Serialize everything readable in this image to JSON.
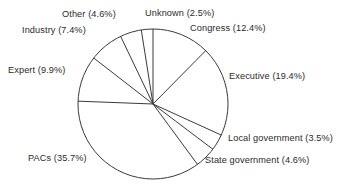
{
  "chart_data": {
    "type": "pie",
    "title": "",
    "subtitle": "",
    "xlabel": "",
    "ylabel": "",
    "grid": false,
    "legend_position": "outside-labels",
    "start_angle_deg": 0,
    "direction": "clockwise",
    "categories": [
      "Congress",
      "Executive",
      "Local government",
      "State government",
      "PACs",
      "Expert",
      "Industry",
      "Other",
      "Unknown"
    ],
    "values": [
      12.4,
      19.4,
      3.5,
      4.6,
      35.7,
      9.9,
      7.4,
      4.6,
      2.5
    ],
    "value_unit": "%",
    "slices": [
      {
        "name": "Congress",
        "value": 12.4,
        "label": "Congress (12.4%)"
      },
      {
        "name": "Executive",
        "value": 19.4,
        "label": "Executive (19.4%)"
      },
      {
        "name": "Local government",
        "value": 3.5,
        "label": "Local government (3.5%)"
      },
      {
        "name": "State government",
        "value": 4.6,
        "label": "State government (4.6%)"
      },
      {
        "name": "PACs",
        "value": 35.7,
        "label": "PACs (35.7%)"
      },
      {
        "name": "Expert",
        "value": 9.9,
        "label": "Expert (9.9%)"
      },
      {
        "name": "Industry",
        "value": 7.4,
        "label": "Industry (7.4%)"
      },
      {
        "name": "Other",
        "value": 4.6,
        "label": "Other (4.6%)"
      },
      {
        "name": "Unknown",
        "value": 2.5,
        "label": "Unknown  (2.5%)"
      }
    ]
  },
  "labels": {
    "unknown": "Unknown  (2.5%)",
    "congress": "Congress (12.4%)",
    "executive": "Executive (19.4%)",
    "local_government": "Local government (3.5%)",
    "state_government": "State government (4.6%)",
    "pacs": "PACs (35.7%)",
    "expert": "Expert (9.9%)",
    "industry": "Industry (7.4%)",
    "other": "Other (4.6%)"
  },
  "style": {
    "stroke_color": "#3a3a3a",
    "background_color": "#ffffff",
    "text_color": "#2b2b2b"
  },
  "geometry": {
    "center_x": 153,
    "center_y": 104,
    "radius": 75
  }
}
